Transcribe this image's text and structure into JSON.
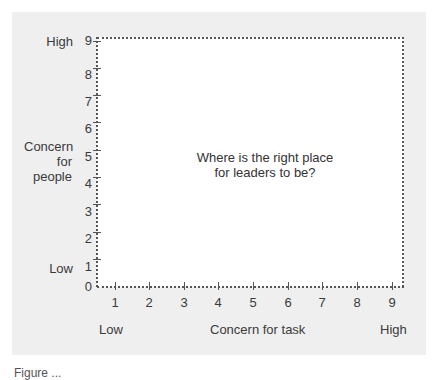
{
  "diagram": {
    "type": "grid",
    "center_text_line1": "Where is the right place",
    "center_text_line2": "for leaders to be?",
    "y_axis": {
      "title_line1": "Concern",
      "title_line2": "for",
      "title_line3": "people",
      "high_label": "High",
      "low_label": "Low",
      "ticks": [
        "0",
        "1",
        "2",
        "3",
        "4",
        "5",
        "6",
        "7",
        "8",
        "9"
      ]
    },
    "x_axis": {
      "title": "Concern for task",
      "low_label": "Low",
      "high_label": "High",
      "ticks": [
        "1",
        "2",
        "3",
        "4",
        "5",
        "6",
        "7",
        "8",
        "9"
      ]
    }
  },
  "caption": "Figure ..."
}
